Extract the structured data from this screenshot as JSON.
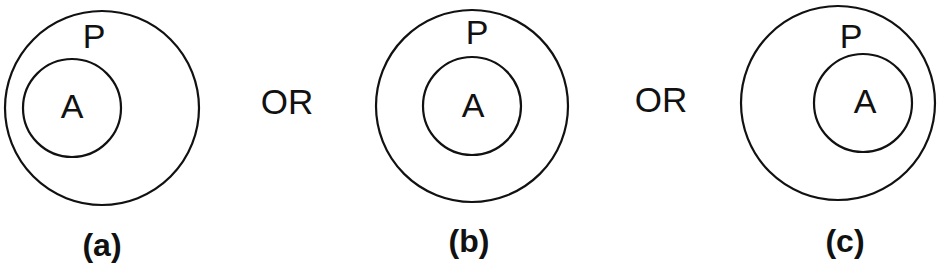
{
  "diagram": {
    "type": "venn-subset-cases",
    "colors": {
      "stroke": "#111111",
      "text": "#111111",
      "background": "#ffffff"
    },
    "panels": [
      {
        "caption": "(a)",
        "outer": {
          "label": "P",
          "cx": 102,
          "cy": 108,
          "r": 97
        },
        "inner": {
          "label": "A",
          "cx": 72,
          "cy": 108,
          "r": 49,
          "position": "left"
        },
        "p_label_pos": {
          "x": 94,
          "y": 48
        },
        "a_label_pos": {
          "x": 72,
          "y": 118
        },
        "caption_pos": {
          "x": 102,
          "y": 256
        }
      },
      {
        "caption": "(b)",
        "outer": {
          "label": "P",
          "cx": 472,
          "cy": 106,
          "r": 96
        },
        "inner": {
          "label": "A",
          "cx": 472,
          "cy": 106,
          "r": 49,
          "position": "center"
        },
        "p_label_pos": {
          "x": 477,
          "y": 44
        },
        "a_label_pos": {
          "x": 473,
          "y": 117
        },
        "caption_pos": {
          "x": 469,
          "y": 252
        }
      },
      {
        "caption": "(c)",
        "outer": {
          "label": "P",
          "cx": 838,
          "cy": 103,
          "r": 97
        },
        "inner": {
          "label": "A",
          "cx": 863,
          "cy": 103,
          "r": 49,
          "position": "right"
        },
        "p_label_pos": {
          "x": 851,
          "y": 48
        },
        "a_label_pos": {
          "x": 865,
          "y": 113
        },
        "caption_pos": {
          "x": 845,
          "y": 252
        }
      }
    ],
    "separators": [
      {
        "text": "OR",
        "x": 287,
        "y": 114
      },
      {
        "text": "OR",
        "x": 661,
        "y": 112
      }
    ]
  }
}
